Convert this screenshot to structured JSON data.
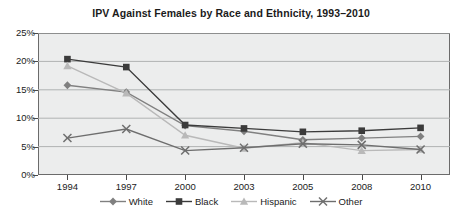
{
  "chart_data": {
    "type": "line",
    "title": "IPV Against Females by Race and Ethnicity, 1993–2010",
    "xlabel": "",
    "ylabel": "",
    "categories": [
      "1994",
      "1997",
      "2000",
      "2003",
      "2005",
      "2008",
      "2010"
    ],
    "x": [
      1994,
      1997,
      2000,
      2003,
      2005,
      2008,
      2010
    ],
    "ylim": [
      0,
      25
    ],
    "ytick_labels": [
      "0%",
      "5%",
      "10%",
      "15%",
      "20%",
      "25%"
    ],
    "ytick_values": [
      0,
      5,
      10,
      15,
      20,
      25
    ],
    "grid": true,
    "legend_position": "bottom",
    "value_unit": "percent",
    "series": [
      {
        "name": "White",
        "marker": "diamond",
        "color": "#808080",
        "values": [
          15.8,
          14.6,
          8.7,
          7.7,
          6.2,
          6.5,
          6.8
        ]
      },
      {
        "name": "Black",
        "marker": "square",
        "color": "#3b3b3b",
        "values": [
          20.4,
          19.0,
          8.8,
          8.2,
          7.6,
          7.8,
          8.3
        ]
      },
      {
        "name": "Hispanic",
        "marker": "triangle",
        "color": "#b9b9b9",
        "values": [
          19.2,
          14.4,
          7.0,
          4.7,
          5.7,
          4.3,
          4.5
        ]
      },
      {
        "name": "Other",
        "marker": "cross",
        "color": "#6e6e6e",
        "values": [
          6.5,
          8.1,
          4.3,
          4.8,
          5.5,
          5.3,
          4.5
        ]
      }
    ]
  },
  "plot": {
    "background_color": "#eceded",
    "border_color": "#6b6b6b",
    "gridline_color": "#b0b2b2"
  }
}
